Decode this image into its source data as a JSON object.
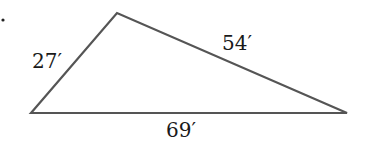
{
  "figure": {
    "marker": ".",
    "triangle": {
      "vertices": {
        "left": [
          31,
          113
        ],
        "top": [
          117,
          13
        ],
        "right": [
          347,
          113
        ]
      },
      "sides": [
        {
          "id": "left",
          "label": "27′"
        },
        {
          "id": "top-right",
          "label": "54′"
        },
        {
          "id": "bottom",
          "label": "69′"
        }
      ],
      "stroke_color": "#555555"
    }
  }
}
